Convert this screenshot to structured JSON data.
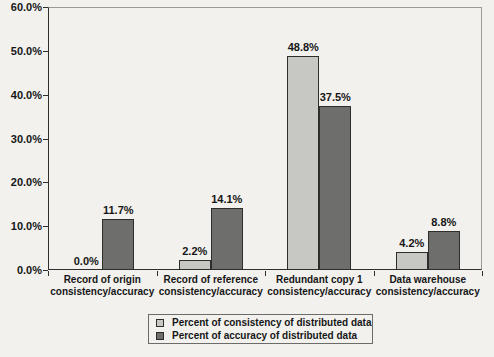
{
  "figure": {
    "background_color": "#f2f1ee",
    "axis_color": "#2f2f2f",
    "plot_border_color": "#9a9a98"
  },
  "chart_data": {
    "type": "bar",
    "title": "",
    "xlabel": "",
    "ylabel": "",
    "ylim": [
      0,
      60
    ],
    "grid": false,
    "legend_position": "bottom",
    "y_ticks": [
      "0.0%",
      "10.0%",
      "20.0%",
      "30.0%",
      "40.0%",
      "50.0%",
      "60.0%"
    ],
    "categories": [
      "Record of origin\nconsistency/accuracy",
      "Record of reference\nconsistency/accuracy",
      "Redundant copy 1\nconsistency/accuracy",
      "Data warehouse\nconsistency/accuracy"
    ],
    "series": [
      {
        "name": "Percent of consistency of distributed data",
        "color": "#c7c7c4",
        "values": [
          0.0,
          2.2,
          48.8,
          4.2
        ],
        "labels": [
          "0.0%",
          "2.2%",
          "48.8%",
          "4.2%"
        ]
      },
      {
        "name": "Percent of accuracy of distributed data",
        "color": "#6e6e6c",
        "values": [
          11.7,
          14.1,
          37.5,
          8.8
        ],
        "labels": [
          "11.7%",
          "14.1%",
          "37.5%",
          "8.8%"
        ]
      }
    ]
  }
}
